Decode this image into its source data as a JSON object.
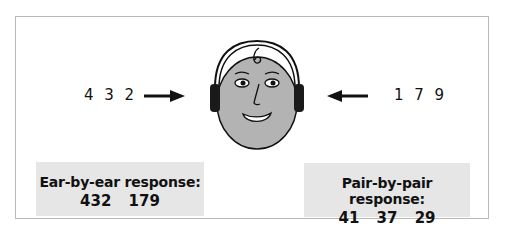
{
  "figure": {
    "left_input": {
      "digits": "4 3 2",
      "arrow": "arrow-right"
    },
    "right_input": {
      "digits": "1 7 9",
      "arrow": "arrow-left"
    },
    "center": {
      "icon": "head-with-headphones"
    },
    "left_box": {
      "title": "Ear-by-ear response:",
      "values": "432 179"
    },
    "right_box": {
      "title": "Pair-by-pair response:",
      "values": "41 37 29"
    },
    "colors": {
      "face": "#b3b3b3",
      "box_bg": "#e6e6e6",
      "headphone": "#1a1a1a",
      "frame": "#b8b8b8"
    }
  }
}
